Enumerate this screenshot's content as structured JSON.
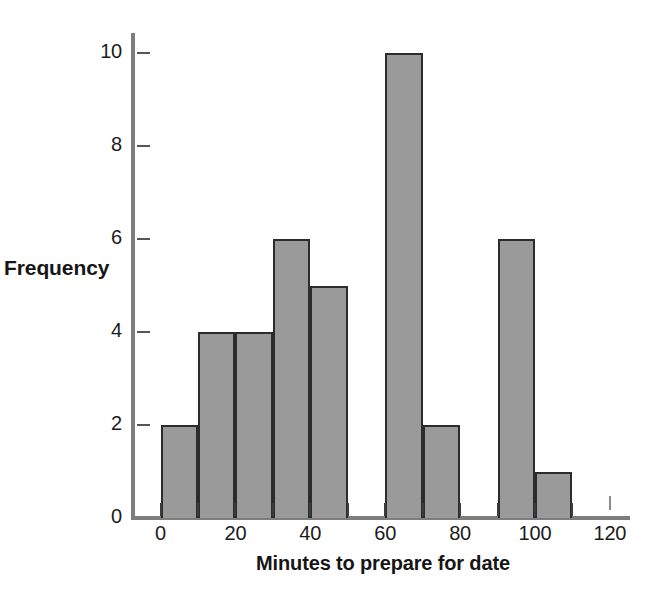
{
  "chart_data": {
    "type": "bar",
    "chart_subtype": "histogram",
    "title": "",
    "xlabel": "Minutes to prepare for date",
    "ylabel": "Frequency",
    "bin_width": 10,
    "bin_edges": [
      0,
      10,
      20,
      30,
      40,
      50,
      60,
      70,
      80,
      90,
      100,
      110,
      120
    ],
    "categories": [
      "0-10",
      "10-20",
      "20-30",
      "30-40",
      "40-50",
      "50-60",
      "60-70",
      "70-80",
      "80-90",
      "90-100",
      "100-110",
      "110-120"
    ],
    "values": [
      2,
      4,
      4,
      6,
      5,
      0,
      10,
      2,
      0,
      6,
      1,
      0
    ],
    "bars": [
      {
        "bin_start": 0,
        "bin_end": 10,
        "value": 2
      },
      {
        "bin_start": 10,
        "bin_end": 20,
        "value": 4
      },
      {
        "bin_start": 20,
        "bin_end": 30,
        "value": 4
      },
      {
        "bin_start": 30,
        "bin_end": 40,
        "value": 6
      },
      {
        "bin_start": 40,
        "bin_end": 50,
        "value": 5
      },
      {
        "bin_start": 50,
        "bin_end": 60,
        "value": 0
      },
      {
        "bin_start": 60,
        "bin_end": 70,
        "value": 10
      },
      {
        "bin_start": 70,
        "bin_end": 80,
        "value": 2
      },
      {
        "bin_start": 80,
        "bin_end": 90,
        "value": 0
      },
      {
        "bin_start": 90,
        "bin_end": 100,
        "value": 6
      },
      {
        "bin_start": 100,
        "bin_end": 110,
        "value": 1
      },
      {
        "bin_start": 110,
        "bin_end": 120,
        "value": 0
      }
    ],
    "xlim": [
      0,
      125
    ],
    "ylim": [
      0,
      10.7
    ],
    "xticks": [
      0,
      10,
      20,
      30,
      40,
      50,
      60,
      70,
      80,
      90,
      100,
      110,
      120
    ],
    "xtick_labels": [
      "0",
      "",
      "20",
      "",
      "40",
      "",
      "60",
      "",
      "80",
      "",
      "100",
      "",
      "120"
    ],
    "yticks": [
      0,
      2,
      4,
      6,
      8,
      10
    ],
    "ytick_labels": [
      "0",
      "2",
      "4",
      "6",
      "8",
      "10"
    ],
    "grid": false,
    "legend": false,
    "legend_position": "none",
    "colors": {
      "bar_fill": "#9a9a9a",
      "bar_edge": "#2c2c2c",
      "axis": "#7d7d7d",
      "tick": "#3b3b3b",
      "text": "#1b1b1b",
      "background": "#ffffff"
    }
  }
}
